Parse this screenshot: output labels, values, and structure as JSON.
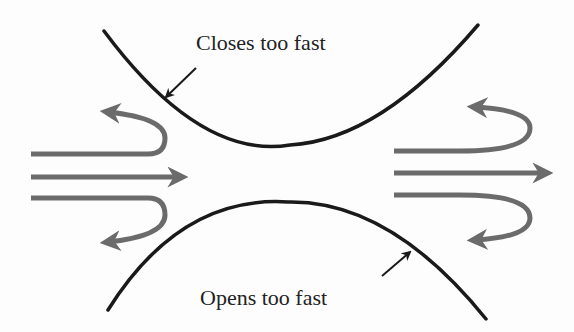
{
  "diagram": {
    "labels": {
      "top": "Closes too fast",
      "bottom": "Opens too fast"
    },
    "colors": {
      "curve": "#1a1a1a",
      "flow_arrow": "#6b6b6b",
      "background": "#fdfdfd",
      "text": "#222222"
    },
    "icons": {
      "flow": "arrow-right-icon",
      "reflux": "u-turn-arrow-icon",
      "pointer": "pointer-arrow-icon"
    }
  }
}
